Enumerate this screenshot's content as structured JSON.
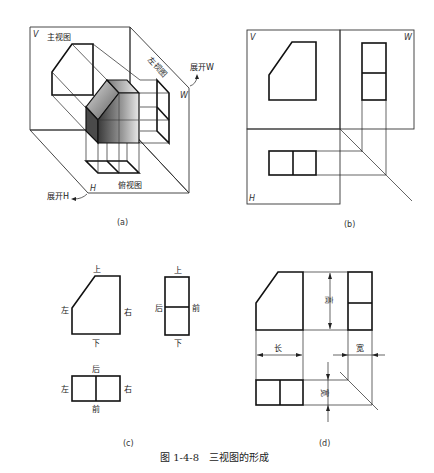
{
  "figure": {
    "caption": "图 1-4-8　三视图的形成",
    "panels": {
      "a": {
        "label": "(a)",
        "plane_v": "V",
        "plane_w": "W",
        "plane_h": "H",
        "front_view": "主视图",
        "left_view": "左视图",
        "top_view": "俯视图",
        "unfold_w": "展开W",
        "unfold_h": "展开H"
      },
      "b": {
        "label": "(b)",
        "plane_v": "V",
        "plane_w": "W",
        "plane_h": "H"
      },
      "c": {
        "label": "(c)",
        "front": {
          "top": "上",
          "bottom": "下",
          "left": "左",
          "right": "右"
        },
        "side": {
          "top": "上",
          "bottom": "下",
          "left": "后",
          "right": "前"
        },
        "plan": {
          "top": "后",
          "bottom": "前",
          "left": "左",
          "right": "右"
        }
      },
      "d": {
        "label": "(d)",
        "dim_length": "长",
        "dim_height": "高",
        "dim_width_h": "宽",
        "dim_width_v": "宽"
      }
    }
  }
}
